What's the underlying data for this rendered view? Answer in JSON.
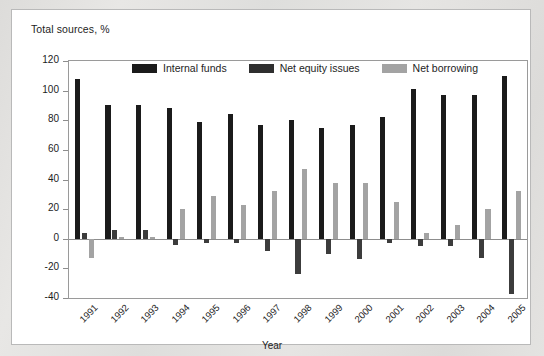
{
  "figure": {
    "axis_note": "Total sources, %",
    "xlabel": "Year"
  },
  "legend": {
    "items": [
      {
        "label": "Internal funds",
        "color": "#1b1b1b",
        "key": "internal"
      },
      {
        "label": "Net equity issues",
        "color": "#2f2f2f",
        "key": "equity"
      },
      {
        "label": "Net borrowing",
        "color": "#a3a3a3",
        "key": "borrow"
      }
    ]
  },
  "chart_data": {
    "type": "bar",
    "title": "Total sources, %",
    "xlabel": "Year",
    "ylabel": "Total sources, %",
    "ylim": [
      -40,
      120
    ],
    "yticks": [
      120,
      100,
      80,
      60,
      40,
      20,
      0,
      -20,
      -40
    ],
    "ytick_labels": [
      "120",
      "100",
      "80",
      "60",
      "40",
      "20",
      "0",
      "-20",
      "-40"
    ],
    "grid": false,
    "legend_position": "top-center",
    "categories": [
      "1991",
      "1992",
      "1993",
      "1994",
      "1995",
      "1996",
      "1997",
      "1998",
      "1999",
      "2000",
      "2001",
      "2002",
      "2003",
      "2004",
      "2005"
    ],
    "series": [
      {
        "name": "Internal funds",
        "color": "#1b1b1b",
        "values": [
          108,
          90,
          90,
          88,
          79,
          84,
          77,
          80,
          75,
          77,
          82,
          101,
          97,
          97,
          110
        ]
      },
      {
        "name": "Net equity issues",
        "color": "#2f2f2f",
        "values": [
          4,
          6,
          6,
          -4,
          -3,
          -3,
          -8,
          -24,
          -10,
          -14,
          -3,
          -5,
          -5,
          -13,
          -37
        ]
      },
      {
        "name": "Net borrowing",
        "color": "#a3a3a3",
        "values": [
          -13,
          1,
          1,
          20,
          29,
          23,
          32,
          47,
          38,
          38,
          25,
          4,
          9,
          20,
          32
        ]
      }
    ]
  }
}
